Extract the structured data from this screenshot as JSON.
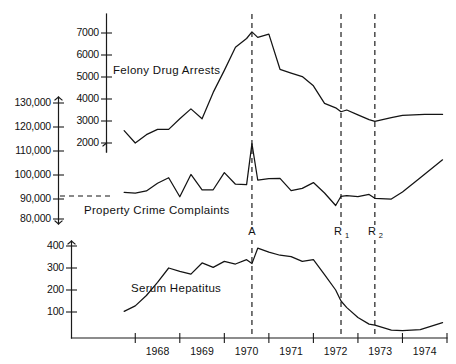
{
  "figure": {
    "background": "#ffffff",
    "ink": "#141414",
    "x_axis": {
      "label": "",
      "year_labels": [
        "1968",
        "1969",
        "1970",
        "1971",
        "1972",
        "1973",
        "1974"
      ],
      "range": [
        1967.5,
        1975.0
      ],
      "tick_years": [
        1968.0,
        1969.0,
        1970.0,
        1971.0,
        1972.0,
        1973.0,
        1974.0,
        1975.0
      ]
    },
    "event_markers": [
      {
        "name": "A",
        "sub": "",
        "year": 1970.62
      },
      {
        "name": "R",
        "sub": "1",
        "year": 1972.62
      },
      {
        "name": "R",
        "sub": "2",
        "year": 1973.38
      }
    ]
  },
  "chart_data": [
    {
      "type": "line",
      "title": "Felony Drug Arrests",
      "series_label": "Felony Drug Arrests",
      "xlabel": "",
      "ylabel": "",
      "ylim": [
        1500,
        7600
      ],
      "yticks": [
        2000,
        3000,
        4000,
        5000,
        6000,
        7000
      ],
      "ytick_labels": [
        "2000",
        "3000",
        "4000",
        "5000",
        "6000",
        "7000"
      ],
      "grid": false,
      "x": [
        1967.75,
        1968.0,
        1968.25,
        1968.5,
        1968.75,
        1969.0,
        1969.25,
        1969.5,
        1969.75,
        1970.0,
        1970.25,
        1970.5,
        1970.62,
        1970.75,
        1971.0,
        1971.25,
        1971.5,
        1971.75,
        1972.0,
        1972.25,
        1972.5,
        1972.62,
        1972.75,
        1973.0,
        1973.25,
        1973.38,
        1973.75,
        1974.0,
        1974.5,
        1974.9
      ],
      "values": [
        2560,
        2000,
        2380,
        2620,
        2620,
        3100,
        3550,
        3100,
        4300,
        5300,
        6350,
        6750,
        7050,
        6800,
        6950,
        5350,
        5180,
        5020,
        4600,
        3800,
        3600,
        3420,
        3500,
        3280,
        3060,
        2980,
        3150,
        3260,
        3300,
        3300
      ]
    },
    {
      "type": "line",
      "title": "Property Crime Complaints",
      "series_label": "Property Crime Complaints",
      "xlabel": "",
      "ylabel": "",
      "ylim": [
        74000,
        136000
      ],
      "yticks": [
        80000,
        90000,
        100000,
        110000,
        120000,
        130000
      ],
      "ytick_labels": [
        "80,000",
        "90,000",
        "100,000",
        "110,000",
        "120,000",
        "130,000"
      ],
      "grid": false,
      "baseline_value": 91500,
      "x": [
        1967.75,
        1968.0,
        1968.25,
        1968.5,
        1968.75,
        1969.0,
        1969.25,
        1969.5,
        1969.75,
        1970.0,
        1970.25,
        1970.5,
        1970.62,
        1970.75,
        1971.0,
        1971.25,
        1971.5,
        1971.75,
        1972.0,
        1972.25,
        1972.5,
        1972.62,
        1972.75,
        1973.0,
        1973.25,
        1973.38,
        1973.75,
        1974.0,
        1974.4,
        1974.9
      ],
      "values": [
        91500,
        91200,
        92100,
        95400,
        97800,
        89600,
        99200,
        92600,
        92600,
        100000,
        95000,
        94800,
        112500,
        96800,
        97400,
        97500,
        92200,
        93200,
        95700,
        91200,
        85800,
        89800,
        90100,
        89600,
        90600,
        88900,
        88600,
        91600,
        97800,
        105500
      ]
    },
    {
      "type": "line",
      "title": "Serum Hepatitus",
      "series_label": "Serum Hepatitus",
      "xlabel": "",
      "ylabel": "",
      "ylim": [
        0,
        430
      ],
      "yticks": [
        100,
        200,
        300,
        400
      ],
      "ytick_labels": [
        "100",
        "200",
        "300",
        "400"
      ],
      "grid": false,
      "x": [
        1967.75,
        1968.0,
        1968.25,
        1968.5,
        1968.75,
        1969.0,
        1969.25,
        1969.5,
        1969.75,
        1970.0,
        1970.25,
        1970.5,
        1970.62,
        1970.75,
        1971.0,
        1971.25,
        1971.5,
        1971.75,
        1972.0,
        1972.25,
        1972.5,
        1972.62,
        1972.75,
        1973.0,
        1973.25,
        1973.38,
        1973.75,
        1974.0,
        1974.4,
        1974.9
      ],
      "values": [
        103,
        128,
        175,
        235,
        300,
        285,
        272,
        323,
        303,
        330,
        318,
        338,
        320,
        390,
        372,
        358,
        352,
        330,
        338,
        270,
        200,
        150,
        120,
        75,
        45,
        40,
        18,
        15,
        20,
        52
      ]
    }
  ]
}
